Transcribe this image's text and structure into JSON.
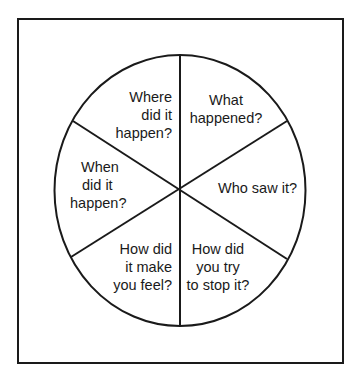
{
  "diagram": {
    "type": "pie-wheel",
    "segment_count": 6,
    "colors": {
      "stroke": "#1a1a1a",
      "background": "#ffffff"
    },
    "segments": [
      {
        "id": "where",
        "position": "top-left",
        "lines": [
          "Where",
          "did it",
          "happen?"
        ]
      },
      {
        "id": "what",
        "position": "top-right",
        "lines": [
          "What",
          "happened?"
        ]
      },
      {
        "id": "who",
        "position": "right",
        "lines": [
          "Who saw it?"
        ]
      },
      {
        "id": "stop",
        "position": "bottom-right",
        "lines": [
          "How did",
          "you try",
          "to stop it?"
        ]
      },
      {
        "id": "feel",
        "position": "bottom-left",
        "lines": [
          "How did",
          "it make",
          "you feel?"
        ]
      },
      {
        "id": "when",
        "position": "left",
        "lines": [
          "When",
          "did it",
          "happen?"
        ]
      }
    ]
  }
}
